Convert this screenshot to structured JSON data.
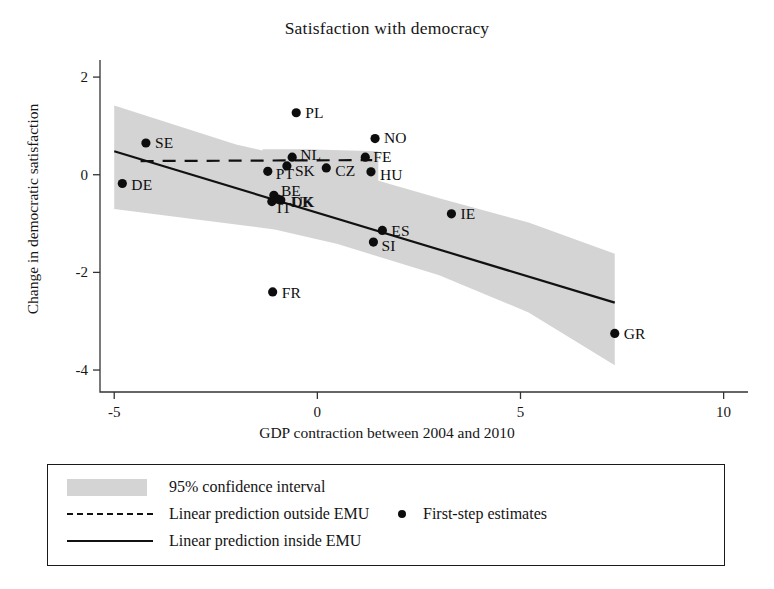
{
  "chart_data": {
    "type": "scatter",
    "title": "Satisfaction with democracy",
    "xlabel": "GDP contraction between 2004 and 2010",
    "ylabel": "Change in democratic satisfaction",
    "xlim": [
      -5.35,
      10.6
    ],
    "ylim": [
      -4.45,
      2.35
    ],
    "xticks": [
      -5,
      0,
      5,
      10
    ],
    "xtick_labels": [
      "-5",
      "0",
      "5",
      "10"
    ],
    "yticks": [
      2,
      0,
      -2,
      -4
    ],
    "ytick_labels": [
      "2",
      "0",
      "-2",
      "-4"
    ],
    "grid": false,
    "legend_position": "below-axes",
    "points": [
      {
        "label": "DE",
        "x": -4.8,
        "y": -0.18,
        "label_dx": 9,
        "label_dy": 1
      },
      {
        "label": "SE",
        "x": -4.22,
        "y": 0.65,
        "label_dx": 9,
        "label_dy": 0
      },
      {
        "label": "PL",
        "x": -0.52,
        "y": 1.27,
        "label_dx": 9,
        "label_dy": 0
      },
      {
        "label": "NL",
        "x": -0.62,
        "y": 0.36,
        "label_dx": 8,
        "label_dy": -2
      },
      {
        "label": "PT",
        "x": -1.22,
        "y": 0.07,
        "label_dx": 8,
        "label_dy": 3
      },
      {
        "label": "SK",
        "x": -0.75,
        "y": 0.18,
        "label_dx": 8,
        "label_dy": 5
      },
      {
        "label": "CZ",
        "x": 0.22,
        "y": 0.14,
        "label_dx": 9,
        "label_dy": 3
      },
      {
        "label": "NO",
        "x": 1.42,
        "y": 0.74,
        "label_dx": 9,
        "label_dy": -1
      },
      {
        "label": "FE",
        "x": 1.18,
        "y": 0.36,
        "label_dx": 8,
        "label_dy": 0
      },
      {
        "label": "HU",
        "x": 1.32,
        "y": 0.06,
        "label_dx": 9,
        "label_dy": 3
      },
      {
        "label": "BE",
        "x": -1.07,
        "y": -0.42,
        "label_dx": 7,
        "label_dy": -4
      },
      {
        "label": "DK",
        "x": -0.9,
        "y": -0.52,
        "label_dx": 10,
        "label_dy": 2
      },
      {
        "label": "IT",
        "x": -1.12,
        "y": -0.55,
        "label_dx": 5,
        "label_dy": 6
      },
      {
        "label": "UK",
        "x": -0.97,
        "y": -0.5,
        "label_dx": 14,
        "label_dy": 3
      },
      {
        "label": "FR",
        "x": -1.1,
        "y": -2.4,
        "label_dx": 9,
        "label_dy": 1
      },
      {
        "label": "SI",
        "x": 1.38,
        "y": -1.38,
        "label_dx": 8,
        "label_dy": 4
      },
      {
        "label": "ES",
        "x": 1.6,
        "y": -1.14,
        "label_dx": 9,
        "label_dy": 1
      },
      {
        "label": "IE",
        "x": 3.3,
        "y": -0.8,
        "label_dx": 9,
        "label_dy": 0
      },
      {
        "label": "GR",
        "x": 7.32,
        "y": -3.25,
        "label_dx": 9,
        "label_dy": 1
      }
    ],
    "series": [
      {
        "name": "Linear prediction inside EMU",
        "style": "solid",
        "x": [
          -5.0,
          7.32
        ],
        "y": [
          0.48,
          -2.62
        ]
      },
      {
        "name": "Linear prediction outside EMU",
        "style": "dashed",
        "x": [
          -4.35,
          1.35
        ],
        "y": [
          0.28,
          0.3
        ]
      }
    ],
    "confidence_band": {
      "name": "95% confidence interval",
      "level": "95%",
      "color": "#d4d4d4",
      "inside_emu": {
        "x": [
          -5.0,
          -2.0,
          -1.05,
          0.5,
          3.0,
          5.2,
          7.32
        ],
        "upper": [
          1.42,
          0.62,
          0.44,
          0.12,
          -0.48,
          -0.98,
          -1.62
        ],
        "lower": [
          -0.7,
          -1.02,
          -1.12,
          -1.42,
          -2.06,
          -2.82,
          -3.9
        ]
      },
      "outside_emu": {
        "x": [
          -1.35,
          -0.3,
          0.6,
          1.5
        ],
        "upper": [
          0.52,
          0.52,
          0.5,
          0.48
        ],
        "lower": [
          -0.1,
          -0.18,
          -0.24,
          -0.3
        ]
      }
    }
  },
  "legend": {
    "ci_label": "95% confidence interval",
    "outside_label": "Linear prediction outside EMU",
    "inside_label": "Linear prediction inside EMU",
    "estimates_label": "First-step estimates"
  }
}
